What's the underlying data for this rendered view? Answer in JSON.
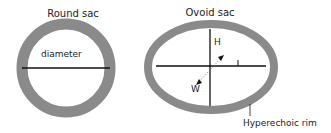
{
  "round_sac": {
    "title": "Round sac",
    "measure_label": "diameter"
  },
  "ovoid_sac": {
    "title": "Ovoid sac",
    "height_label": "H",
    "length_label": "L",
    "width_label": "W",
    "rim_label": "Hyperechoic rim"
  },
  "colors": {
    "rim": "#8a8a8a",
    "line": "#111111",
    "text": "#222222"
  }
}
